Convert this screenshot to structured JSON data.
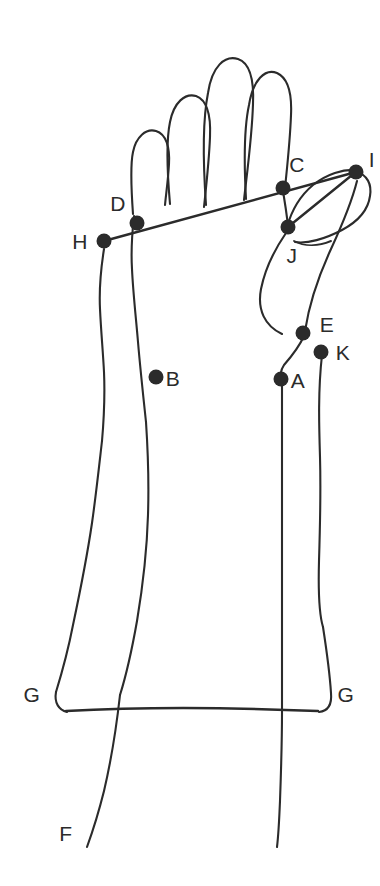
{
  "figure": {
    "type": "line-drawing",
    "background_color": "#ffffff",
    "stroke_color": "#2b2b2b",
    "canvas": {
      "width": 380,
      "height": 886
    }
  },
  "labels": [
    {
      "id": "A",
      "text": "A",
      "x": 298,
      "y": 380,
      "dot_x": 281,
      "dot_y": 379,
      "has_dot": true
    },
    {
      "id": "B",
      "text": "B",
      "x": 173,
      "y": 378,
      "dot_x": 156,
      "dot_y": 377,
      "has_dot": true
    },
    {
      "id": "C",
      "text": "C",
      "x": 297,
      "y": 164,
      "dot_x": 283,
      "dot_y": 188,
      "has_dot": true
    },
    {
      "id": "D",
      "text": "D",
      "x": 118,
      "y": 203,
      "dot_x": 137,
      "dot_y": 223,
      "has_dot": true
    },
    {
      "id": "E",
      "text": "E",
      "x": 327,
      "y": 324,
      "dot_x": 303,
      "dot_y": 333,
      "has_dot": true
    },
    {
      "id": "F",
      "text": "F",
      "x": 66,
      "y": 833,
      "dot_x": 0,
      "dot_y": 0,
      "has_dot": false
    },
    {
      "id": "G-left",
      "text": "G",
      "x": 32,
      "y": 694,
      "dot_x": 0,
      "dot_y": 0,
      "has_dot": false
    },
    {
      "id": "G-right",
      "text": "G",
      "x": 346,
      "y": 694,
      "dot_x": 0,
      "dot_y": 0,
      "has_dot": false
    },
    {
      "id": "H",
      "text": "H",
      "x": 80,
      "y": 241,
      "dot_x": 104,
      "dot_y": 241,
      "has_dot": true
    },
    {
      "id": "I",
      "text": "I",
      "x": 372,
      "y": 159,
      "dot_x": 356,
      "dot_y": 172,
      "has_dot": true
    },
    {
      "id": "J",
      "text": "J",
      "x": 292,
      "y": 255,
      "dot_x": 288,
      "dot_y": 227,
      "has_dot": true
    },
    {
      "id": "K",
      "text": "K",
      "x": 343,
      "y": 352,
      "dot_x": 321,
      "dot_y": 352,
      "has_dot": true
    }
  ],
  "node_dot_radius": 7.5,
  "strokes": {
    "finger_index": "M 168 202 C 166 168 166 140 170 122 C 173 104 184 96 194 99 C 205 102 209 116 208 136 C 207 160 204 186 202 205",
    "finger_middle": "M 204 203 C 202 160 202 118 206 94 C 210 68 222 58 234 62 C 246 66 250 82 249 104 C 248 136 243 172 240 198",
    "finger_ring": "M 242 197 C 241 162 241 128 245 106 C 249 82 260 71 271 75 C 282 79 286 94 285 114 C 284 140 282 166 280 186",
    "finger_pinky": "M 133 213 C 131 185 131 165 134 152 C 137 138 146 130 155 133 C 164 136 168 148 167 164 C 166 180 165 193 164 204",
    "hand_left_edge": "M 133 215 C 131 232 131 252 132 268 C 133 290 135 316 137 340 C 139 364 142 392 145 420",
    "hand_left_outer": "M 104 248 C 101 266 99 288 100 308 C 101 330 103 352 104 372 C 105 394 104 418 102 440",
    "forearm_left_inner": "M 145 420 C 147 450 148 482 147 514 C 146 548 142 584 136 620 C 130 654 124 678 119 694",
    "forearm_left_outer": "M 102 440 C 99 466 96 494 92 522 C 87 556 80 592 73 624 C 66 656 60 678 56 691",
    "forearm_left_outer_bottom": "M 56 691 C 54 702 58 709 66 711 C 76 713 90 712 104 711",
    "cuff_bottom": "M 66 711 C 120 707 200 706 265 708 C 290 709 308 710 318 711",
    "cuff_right_up": "M 318 711 C 328 710 332 703 331 692 C 330 676 327 652 323 626",
    "wrist_left_line": "M 119 694 C 116 720 110 760 103 790 C 96 818 90 835 86 846",
    "wrist_right_line": "M 281 712 C 281 740 281 772 280 800 C 279 824 278 838 277 846",
    "forearm_right_inner": "M 281 388 C 281 420 281 456 281 492 C 281 530 281 570 281 608 C 281 652 281 690 281 712",
    "forearm_right_outer": "M 314 360 C 317 392 319 424 320 456 C 321 492 320 528 319 560 C 318 596 320 616 323 626",
    "thumb_left_lobe": "M 287 232 C 276 248 266 268 262 288 C 258 308 264 324 281 334",
    "thumb_right_lobe": "M 356 180 C 351 200 342 222 330 248 C 318 274 308 304 304 330",
    "thumb_tip_upper": "M 287 228 C 292 210 300 196 312 186 C 326 175 342 170 356 171",
    "thumb_tip_outer": "M 356 171 C 366 173 371 182 369 194 C 367 208 356 220 342 228 C 324 238 306 243 294 241",
    "thumb_inner_seam": "M 294 241 C 304 246 318 246 330 242",
    "hand_to_wrist_right": "M 283 190 C 285 202 287 216 288 224",
    "hand_thumb_to_E": "M 303 336 C 298 346 290 356 283 364 C 279 370 279 376 281 380",
    "K_stem": "M 321 352 C 320 368 319 392 318 414",
    "E_to_K": "M 303 334 C 309 340 315 346 321 351",
    "top_measure_line": "M 104 241 L 356 172",
    "lower_measure_line": "M 288 227 L 356 172",
    "cuff_measure_line": "M 66 711 L 318 711"
  }
}
